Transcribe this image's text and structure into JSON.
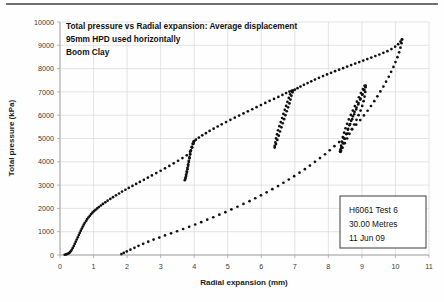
{
  "figure": {
    "title_lines": [
      "Total pressure vs Radial expansion: Average displacement",
      "95mm HPD used horizontally",
      "Boom Clay"
    ],
    "annotation_lines": [
      "H6061 Test 6",
      "30.00 Metres",
      "11 Jun 09"
    ],
    "scan_artifact_text": "",
    "marker_color": "#111111",
    "grid_color": "#d9d9d9",
    "axis_color": "#a6a6a6"
  },
  "chart_data": {
    "type": "scatter",
    "title": "Total pressure vs Radial expansion: Average displacement",
    "subtitle": "95mm HPD used horizontally",
    "subtitle2": "Boom Clay",
    "xlabel": "Radial expansion (mm)",
    "ylabel": "Total pressure (kPa)",
    "xlim": [
      0,
      11
    ],
    "ylim": [
      0,
      10000
    ],
    "xticks": [
      0,
      1,
      2,
      3,
      4,
      5,
      6,
      7,
      8,
      9,
      10,
      11
    ],
    "yticks": [
      0,
      1000,
      2000,
      3000,
      4000,
      5000,
      6000,
      7000,
      8000,
      9000,
      10000
    ],
    "grid": true,
    "legend": "none",
    "annotations": [
      "H6061 Test 6",
      "30.00 Metres",
      "11 Jun 09"
    ],
    "series": [
      {
        "name": "Loading: initial expansion",
        "points": [
          [
            0.14,
            10
          ],
          [
            0.18,
            25
          ],
          [
            0.22,
            45
          ],
          [
            0.26,
            70
          ],
          [
            0.29,
            110
          ],
          [
            0.32,
            160
          ],
          [
            0.35,
            225
          ],
          [
            0.38,
            300
          ],
          [
            0.41,
            385
          ],
          [
            0.44,
            475
          ],
          [
            0.47,
            570
          ],
          [
            0.5,
            665
          ],
          [
            0.53,
            760
          ],
          [
            0.56,
            855
          ],
          [
            0.59,
            950
          ],
          [
            0.62,
            1045
          ],
          [
            0.65,
            1135
          ],
          [
            0.68,
            1220
          ],
          [
            0.71,
            1305
          ],
          [
            0.74,
            1385
          ],
          [
            0.78,
            1465
          ],
          [
            0.81,
            1540
          ],
          [
            0.85,
            1615
          ],
          [
            0.89,
            1685
          ],
          [
            0.93,
            1755
          ],
          [
            0.97,
            1820
          ],
          [
            1.01,
            1880
          ],
          [
            1.06,
            1940
          ],
          [
            1.11,
            2000
          ],
          [
            1.16,
            2060
          ],
          [
            1.22,
            2125
          ],
          [
            1.28,
            2190
          ],
          [
            1.35,
            2260
          ],
          [
            1.42,
            2330
          ],
          [
            1.5,
            2405
          ],
          [
            1.58,
            2480
          ],
          [
            1.67,
            2560
          ],
          [
            1.76,
            2640
          ],
          [
            1.85,
            2720
          ],
          [
            1.95,
            2800
          ],
          [
            2.05,
            2880
          ],
          [
            2.16,
            2965
          ],
          [
            2.27,
            3050
          ],
          [
            2.38,
            3135
          ],
          [
            2.5,
            3225
          ],
          [
            2.62,
            3320
          ],
          [
            2.74,
            3415
          ],
          [
            2.87,
            3515
          ],
          [
            3.0,
            3615
          ],
          [
            3.13,
            3720
          ],
          [
            3.26,
            3825
          ],
          [
            3.39,
            3935
          ],
          [
            3.52,
            4045
          ],
          [
            3.65,
            4160
          ],
          [
            3.78,
            4280
          ],
          [
            3.88,
            4430
          ],
          [
            3.94,
            4610
          ],
          [
            3.98,
            4780
          ],
          [
            4.0,
            4890
          ]
        ]
      },
      {
        "name": "Unload-reload loop 1",
        "points": [
          [
            3.99,
            4870
          ],
          [
            3.96,
            4760
          ],
          [
            3.93,
            4620
          ],
          [
            3.9,
            4470
          ],
          [
            3.88,
            4310
          ],
          [
            3.86,
            4150
          ],
          [
            3.84,
            3990
          ],
          [
            3.82,
            3830
          ],
          [
            3.8,
            3680
          ],
          [
            3.78,
            3530
          ],
          [
            3.76,
            3390
          ],
          [
            3.74,
            3270
          ],
          [
            3.72,
            3210
          ],
          [
            3.74,
            3320
          ],
          [
            3.76,
            3450
          ],
          [
            3.78,
            3590
          ],
          [
            3.8,
            3740
          ],
          [
            3.82,
            3890
          ],
          [
            3.84,
            4040
          ],
          [
            3.86,
            4190
          ],
          [
            3.88,
            4340
          ],
          [
            3.9,
            4490
          ],
          [
            3.93,
            4640
          ],
          [
            3.96,
            4780
          ],
          [
            3.99,
            4880
          ]
        ]
      },
      {
        "name": "Loading: segment 2",
        "points": [
          [
            4.05,
            4950
          ],
          [
            4.14,
            5040
          ],
          [
            4.24,
            5135
          ],
          [
            4.35,
            5230
          ],
          [
            4.46,
            5325
          ],
          [
            4.58,
            5420
          ],
          [
            4.7,
            5515
          ],
          [
            4.82,
            5610
          ],
          [
            4.95,
            5705
          ],
          [
            5.08,
            5800
          ],
          [
            5.21,
            5895
          ],
          [
            5.34,
            5985
          ],
          [
            5.47,
            6075
          ],
          [
            5.6,
            6165
          ],
          [
            5.73,
            6255
          ],
          [
            5.86,
            6345
          ],
          [
            5.99,
            6435
          ],
          [
            6.12,
            6525
          ],
          [
            6.25,
            6615
          ],
          [
            6.38,
            6700
          ],
          [
            6.51,
            6785
          ],
          [
            6.63,
            6870
          ],
          [
            6.74,
            6950
          ],
          [
            6.84,
            7015
          ],
          [
            6.92,
            7060
          ]
        ]
      },
      {
        "name": "Unload-reload loop 2",
        "points": [
          [
            6.9,
            7030
          ],
          [
            6.86,
            6900
          ],
          [
            6.82,
            6740
          ],
          [
            6.78,
            6570
          ],
          [
            6.74,
            6400
          ],
          [
            6.7,
            6230
          ],
          [
            6.66,
            6055
          ],
          [
            6.62,
            5880
          ],
          [
            6.58,
            5705
          ],
          [
            6.54,
            5530
          ],
          [
            6.5,
            5355
          ],
          [
            6.47,
            5180
          ],
          [
            6.44,
            5005
          ],
          [
            6.42,
            4830
          ],
          [
            6.4,
            4680
          ],
          [
            6.4,
            4610
          ],
          [
            6.44,
            4760
          ],
          [
            6.48,
            4940
          ],
          [
            6.52,
            5120
          ],
          [
            6.56,
            5300
          ],
          [
            6.6,
            5480
          ],
          [
            6.64,
            5655
          ],
          [
            6.68,
            5830
          ],
          [
            6.72,
            6000
          ],
          [
            6.76,
            6170
          ],
          [
            6.8,
            6340
          ],
          [
            6.84,
            6505
          ],
          [
            6.87,
            6670
          ],
          [
            6.9,
            6830
          ],
          [
            6.93,
            6980
          ],
          [
            6.95,
            7060
          ]
        ]
      },
      {
        "name": "Loading: segment 3",
        "points": [
          [
            7.0,
            7095
          ],
          [
            7.08,
            7160
          ],
          [
            7.17,
            7230
          ],
          [
            7.27,
            7305
          ],
          [
            7.38,
            7380
          ],
          [
            7.49,
            7455
          ],
          [
            7.6,
            7530
          ],
          [
            7.72,
            7605
          ],
          [
            7.84,
            7680
          ],
          [
            7.96,
            7750
          ],
          [
            8.08,
            7820
          ],
          [
            8.2,
            7890
          ],
          [
            8.32,
            7955
          ],
          [
            8.44,
            8020
          ],
          [
            8.56,
            8085
          ],
          [
            8.68,
            8150
          ],
          [
            8.8,
            8215
          ],
          [
            8.92,
            8280
          ],
          [
            9.04,
            8345
          ],
          [
            9.16,
            8410
          ],
          [
            9.28,
            8475
          ],
          [
            9.4,
            8540
          ],
          [
            9.52,
            8605
          ],
          [
            9.64,
            8675
          ],
          [
            9.76,
            8750
          ],
          [
            9.88,
            8840
          ],
          [
            9.99,
            8940
          ],
          [
            10.08,
            9050
          ],
          [
            10.15,
            9160
          ],
          [
            10.19,
            9245
          ]
        ]
      },
      {
        "name": "Unload-reload loop 3",
        "points": [
          [
            9.08,
            7260
          ],
          [
            9.03,
            7120
          ],
          [
            8.97,
            6950
          ],
          [
            8.91,
            6770
          ],
          [
            8.85,
            6580
          ],
          [
            8.79,
            6390
          ],
          [
            8.73,
            6200
          ],
          [
            8.67,
            6010
          ],
          [
            8.61,
            5820
          ],
          [
            8.56,
            5630
          ],
          [
            8.51,
            5440
          ],
          [
            8.47,
            5250
          ],
          [
            8.43,
            5060
          ],
          [
            8.4,
            4870
          ],
          [
            8.38,
            4690
          ],
          [
            8.36,
            4530
          ],
          [
            8.35,
            4450
          ],
          [
            8.39,
            4620
          ],
          [
            8.43,
            4810
          ],
          [
            8.48,
            5000
          ],
          [
            8.53,
            5190
          ],
          [
            8.58,
            5380
          ],
          [
            8.63,
            5570
          ],
          [
            8.68,
            5760
          ],
          [
            8.73,
            5950
          ],
          [
            8.78,
            6140
          ],
          [
            8.84,
            6330
          ],
          [
            8.9,
            6520
          ],
          [
            8.96,
            6710
          ],
          [
            9.02,
            6900
          ],
          [
            9.07,
            7090
          ],
          [
            9.1,
            7250
          ],
          [
            9.06,
            7080
          ],
          [
            9.01,
            6880
          ],
          [
            8.95,
            6670
          ],
          [
            8.89,
            6460
          ],
          [
            8.83,
            6250
          ],
          [
            8.77,
            6040
          ],
          [
            8.71,
            5830
          ],
          [
            8.65,
            5620
          ],
          [
            8.59,
            5410
          ],
          [
            8.54,
            5200
          ],
          [
            8.49,
            4990
          ],
          [
            8.45,
            4790
          ],
          [
            8.41,
            4610
          ],
          [
            8.38,
            4470
          ],
          [
            8.36,
            4420
          ],
          [
            8.42,
            4600
          ],
          [
            8.49,
            4800
          ],
          [
            8.56,
            5000
          ],
          [
            8.63,
            5200
          ],
          [
            8.7,
            5400
          ],
          [
            8.77,
            5600
          ],
          [
            8.84,
            5800
          ],
          [
            8.9,
            6000
          ],
          [
            8.96,
            6200
          ],
          [
            9.01,
            6400
          ],
          [
            9.05,
            6600
          ],
          [
            9.08,
            6800
          ],
          [
            9.1,
            7000
          ],
          [
            9.11,
            7200
          ],
          [
            9.11,
            7270
          ]
        ]
      },
      {
        "name": "Unloading curve",
        "points": [
          [
            10.2,
            9250
          ],
          [
            10.18,
            9090
          ],
          [
            10.15,
            8900
          ],
          [
            10.11,
            8700
          ],
          [
            10.06,
            8490
          ],
          [
            10.0,
            8280
          ],
          [
            9.94,
            8070
          ],
          [
            9.87,
            7860
          ],
          [
            9.8,
            7650
          ],
          [
            9.72,
            7440
          ],
          [
            9.64,
            7230
          ],
          [
            9.55,
            7020
          ],
          [
            9.46,
            6810
          ],
          [
            9.37,
            6600
          ],
          [
            9.27,
            6395
          ],
          [
            9.17,
            6190
          ],
          [
            9.06,
            5990
          ],
          [
            8.95,
            5790
          ],
          [
            8.83,
            5595
          ],
          [
            8.71,
            5400
          ],
          [
            8.58,
            5210
          ],
          [
            8.45,
            5025
          ],
          [
            8.32,
            4845
          ],
          [
            8.18,
            4670
          ],
          [
            8.04,
            4495
          ],
          [
            7.9,
            4325
          ],
          [
            7.75,
            4160
          ],
          [
            7.6,
            4000
          ],
          [
            7.45,
            3840
          ],
          [
            7.3,
            3685
          ],
          [
            7.14,
            3535
          ],
          [
            6.98,
            3385
          ],
          [
            6.82,
            3240
          ],
          [
            6.66,
            3100
          ],
          [
            6.5,
            2960
          ],
          [
            6.33,
            2825
          ],
          [
            6.16,
            2690
          ],
          [
            5.99,
            2560
          ],
          [
            5.82,
            2435
          ],
          [
            5.65,
            2310
          ],
          [
            5.47,
            2190
          ],
          [
            5.29,
            2070
          ],
          [
            5.11,
            1955
          ],
          [
            4.93,
            1840
          ],
          [
            4.75,
            1730
          ],
          [
            4.57,
            1620
          ],
          [
            4.39,
            1515
          ],
          [
            4.21,
            1410
          ],
          [
            4.03,
            1310
          ],
          [
            3.85,
            1210
          ],
          [
            3.67,
            1115
          ],
          [
            3.49,
            1020
          ],
          [
            3.31,
            930
          ],
          [
            3.13,
            840
          ],
          [
            2.96,
            750
          ],
          [
            2.79,
            660
          ],
          [
            2.63,
            570
          ],
          [
            2.48,
            480
          ],
          [
            2.34,
            395
          ],
          [
            2.22,
            310
          ],
          [
            2.1,
            230
          ],
          [
            1.99,
            155
          ],
          [
            1.9,
            90
          ],
          [
            1.83,
            40
          ]
        ]
      }
    ]
  }
}
